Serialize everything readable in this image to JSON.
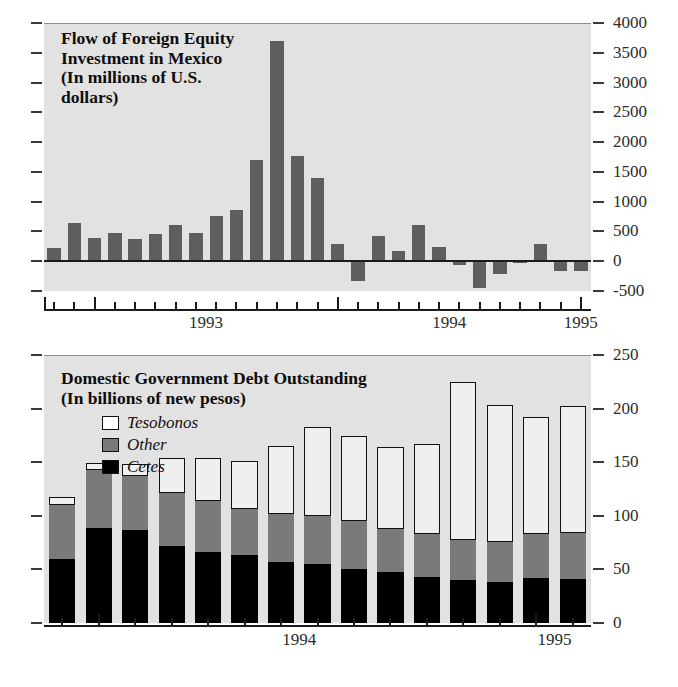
{
  "figure": {
    "background": "#ffffff",
    "panel_background": "#e2e2e2"
  },
  "panels": [
    {
      "id": "flow-of-foreign-equity",
      "title_line1": "Flow of Foreign Equity",
      "title_line2": "Investment in Mexico",
      "title_line3": "(In millions of U.S.",
      "title_line4": "dollars)",
      "y_labels": [
        "4000",
        "3500",
        "3000",
        "2500",
        "2000",
        "1500",
        "1000",
        "500",
        "0",
        "-500"
      ],
      "x_labels": [
        "1993",
        "1994",
        "1995"
      ]
    },
    {
      "id": "domestic-government-debt",
      "title_line1": "Domestic Government Debt Outstanding",
      "title_line2": "(In billions of new pesos)",
      "legend": [
        {
          "label": "Tesobonos",
          "color": "#ffffff"
        },
        {
          "label": "Other",
          "color": "#7a7a7a"
        },
        {
          "label": "Cetes",
          "color": "#000000"
        }
      ],
      "y_labels": [
        "250",
        "200",
        "150",
        "100",
        "50",
        "0"
      ],
      "x_labels": [
        "1994",
        "1995"
      ]
    }
  ],
  "chart_data": [
    {
      "type": "bar",
      "id": "flow-of-foreign-equity",
      "title": "Flow of Foreign Equity Investment in Mexico",
      "subtitle": "(In millions of U.S. dollars)",
      "xlabel": "",
      "ylabel": "",
      "unit": "millions of U.S. dollars",
      "ylim": [
        -500,
        4000
      ],
      "yticks": [
        -500,
        0,
        500,
        1000,
        1500,
        2000,
        2500,
        3000,
        3500,
        4000
      ],
      "ytick_labels": [
        "-500",
        "0",
        "500",
        "1000",
        "1500",
        "2000",
        "2500",
        "3000",
        "3500",
        "4000"
      ],
      "grid": false,
      "legend_position": "none",
      "bar_color": "#5e5e5e",
      "axis_year_labels": [
        "1993",
        "1994",
        "1995"
      ],
      "categories": [
        "1992-11",
        "1992-12",
        "1993-01",
        "1993-02",
        "1993-03",
        "1993-04",
        "1993-05",
        "1993-06",
        "1993-07",
        "1993-08",
        "1993-09",
        "1993-10",
        "1993-11",
        "1993-12",
        "1994-01",
        "1994-02",
        "1994-03",
        "1994-04",
        "1994-05",
        "1994-06",
        "1994-07",
        "1994-08",
        "1994-09",
        "1994-10",
        "1994-11",
        "1994-12",
        "1995-01"
      ],
      "values": [
        230,
        640,
        390,
        470,
        375,
        455,
        600,
        480,
        760,
        860,
        1700,
        3700,
        1760,
        1400,
        290,
        -330,
        420,
        170,
        600,
        240,
        -60,
        -450,
        -210,
        -20,
        290,
        -170,
        -170
      ]
    },
    {
      "type": "bar",
      "id": "domestic-government-debt",
      "subtype": "stacked",
      "title": "Domestic Government Debt Outstanding",
      "subtitle": "(In billions of new pesos)",
      "xlabel": "",
      "ylabel": "",
      "unit": "billions of new pesos",
      "ylim": [
        0,
        250
      ],
      "yticks": [
        0,
        50,
        100,
        150,
        200,
        250
      ],
      "ytick_labels": [
        "0",
        "50",
        "100",
        "150",
        "200",
        "250"
      ],
      "grid": false,
      "legend_position": "upper-left",
      "axis_year_labels": [
        "1994",
        "1995"
      ],
      "categories": [
        "1993-12",
        "1994-01",
        "1994-02",
        "1994-03",
        "1994-04",
        "1994-05",
        "1994-06",
        "1994-07",
        "1994-08",
        "1994-09",
        "1994-10",
        "1994-11",
        "1994-12",
        "1995-01",
        "1995-02"
      ],
      "series": [
        {
          "name": "Cetes",
          "color": "#000000",
          "values": [
            60,
            89,
            87,
            72,
            66,
            63,
            57,
            55,
            50,
            48,
            43,
            40,
            38,
            42,
            41
          ]
        },
        {
          "name": "Other",
          "color": "#7a7a7a",
          "values": [
            50,
            54,
            50,
            49,
            48,
            43,
            45,
            45,
            45,
            40,
            40,
            37,
            38,
            41,
            43
          ]
        },
        {
          "name": "Tesobonos",
          "color": "#ffffff",
          "values": [
            8,
            6,
            11,
            33,
            40,
            45,
            63,
            83,
            79,
            76,
            84,
            148,
            127,
            109,
            118
          ]
        }
      ],
      "totals": [
        118,
        149,
        148,
        154,
        154,
        151,
        165,
        183,
        174,
        164,
        167,
        225,
        203,
        192,
        202
      ]
    }
  ]
}
